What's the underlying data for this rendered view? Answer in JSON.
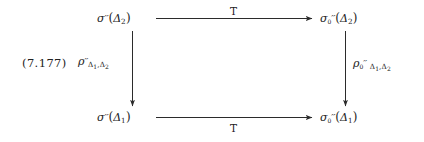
{
  "figure": {
    "kind": "commutative-diagram",
    "equation_number": "(7.177)",
    "background_color": "#ffffff",
    "ink_color": "#222222"
  },
  "nodes": {
    "top_left": {
      "id": "sigma-dprime-delta2",
      "base": "σ",
      "primes": "′′",
      "sub": "",
      "arg_open": "(",
      "arg_base": "Δ",
      "arg_sub": "2",
      "arg_close": ")",
      "plain": "σ′′(Δ2)"
    },
    "top_right": {
      "id": "sigma0-dprime-delta2",
      "base": "σ",
      "primes": "′′",
      "sub": "0",
      "arg_open": "(",
      "arg_base": "Δ",
      "arg_sub": "2",
      "arg_close": ")",
      "plain": "σ₀′′(Δ2)"
    },
    "bottom_left": {
      "id": "sigma-dprime-delta1",
      "base": "σ",
      "primes": "′′",
      "sub": "",
      "arg_open": "(",
      "arg_base": "Δ",
      "arg_sub": "1",
      "arg_close": ")",
      "plain": "σ′′(Δ1)"
    },
    "bottom_right": {
      "id": "sigma0-dprime-delta1",
      "base": "σ",
      "primes": "′′",
      "sub": "0",
      "arg_open": "(",
      "arg_base": "Δ",
      "arg_sub": "1",
      "arg_close": ")",
      "plain": "σ₀′′(Δ1)"
    }
  },
  "arrows": {
    "top": {
      "id": "top-horizontal-arrow",
      "label": "T",
      "label_position": "above",
      "direction": "right"
    },
    "bottom": {
      "id": "bottom-horizontal-arrow",
      "label": "T",
      "label_position": "below",
      "direction": "right"
    },
    "left": {
      "id": "left-vertical-arrow",
      "direction": "down",
      "label": {
        "base": "ρ",
        "primes": "′′",
        "sub_zero": "",
        "sub_delta_a": "Δ",
        "sub_delta_a_index": "1",
        "comma": ",",
        "sub_delta_b": "Δ",
        "sub_delta_b_index": "2",
        "plain": "ρ′′_{Δ1,Δ2}"
      }
    },
    "right": {
      "id": "right-vertical-arrow",
      "direction": "down",
      "label": {
        "base": "ρ",
        "primes": "′′",
        "sub_zero": "0",
        "sub_delta_a": "Δ",
        "sub_delta_a_index": "1",
        "comma": ",",
        "sub_delta_b": "Δ",
        "sub_delta_b_index": "2",
        "plain": "ρ₀′′ Δ1,Δ2"
      }
    }
  }
}
